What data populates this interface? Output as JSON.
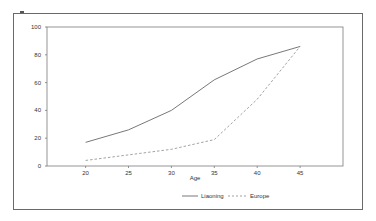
{
  "chart_data": {
    "type": "line",
    "title": "",
    "xlabel": "Age",
    "ylabel": "",
    "x": [
      20,
      25,
      30,
      35,
      40,
      45
    ],
    "series": [
      {
        "name": "Liaoning",
        "values": [
          17,
          26,
          40,
          62,
          77,
          86
        ],
        "style": "solid",
        "color": "#555555"
      },
      {
        "name": "Europe",
        "values": [
          4,
          8,
          12,
          19,
          48,
          86
        ],
        "style": "dashed",
        "color": "#8a8a8a"
      }
    ],
    "xticks": [
      "20",
      "25",
      "30",
      "35",
      "40",
      "45"
    ],
    "yticks": [
      "0",
      "20",
      "40",
      "60",
      "80",
      "100"
    ],
    "ylim": [
      0,
      100
    ],
    "xlim": [
      15.5,
      50
    ],
    "grid": false,
    "legend_position": "bottom-right"
  },
  "legend": {
    "items": [
      {
        "label": "Liaoning"
      },
      {
        "label": "Europe"
      }
    ]
  },
  "axes": {
    "x_label": "Age"
  }
}
